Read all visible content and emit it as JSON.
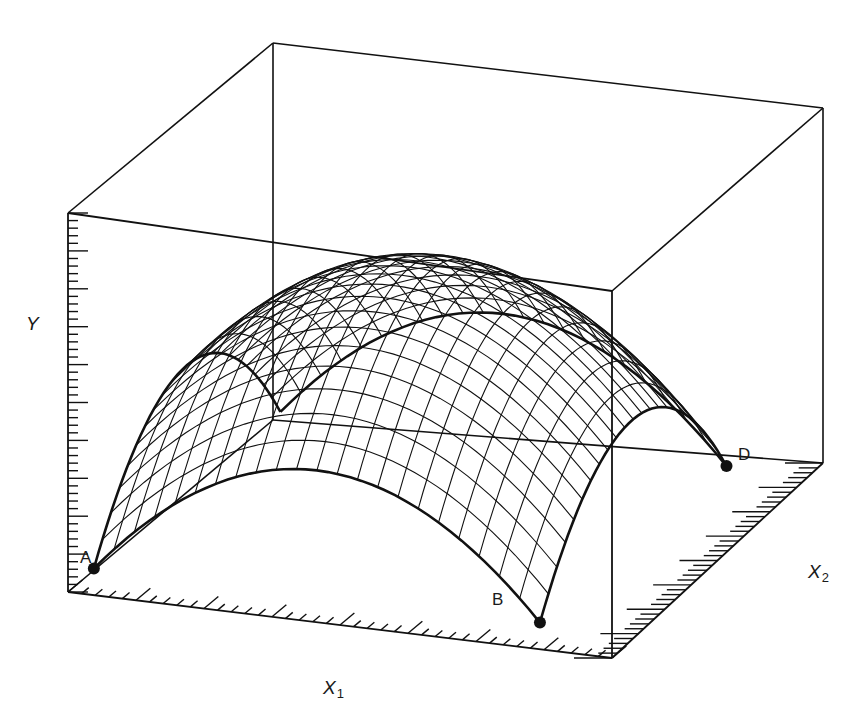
{
  "figure": {
    "axes": {
      "y_label": "Y",
      "x1_label": "X",
      "x1_sub": "1",
      "x2_label": "X",
      "x2_sub": "2"
    },
    "points": [
      {
        "id": "A",
        "label": "A"
      },
      {
        "id": "B",
        "label": "B"
      },
      {
        "id": "D",
        "label": "D"
      }
    ],
    "colors": {
      "ink": "#111111",
      "background": "#ffffff"
    }
  }
}
